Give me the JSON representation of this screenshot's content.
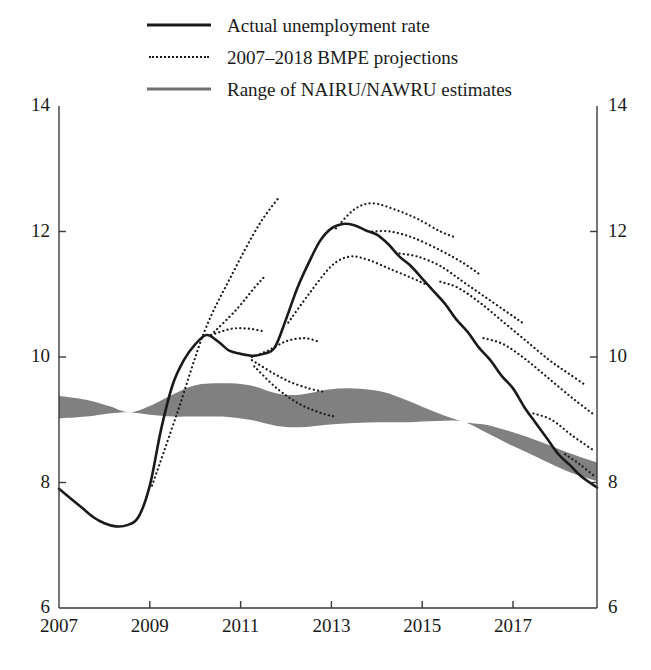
{
  "legend": {
    "position": "top-center",
    "items": [
      {
        "label": "Actual unemployment rate",
        "style": "solid",
        "color": "#1a1a1a",
        "swatch": "solid-line-swatch"
      },
      {
        "label": "2007–2018 BMPE projections",
        "style": "dotted",
        "color": "#1a1a1a",
        "swatch": "dotted-line-swatch"
      },
      {
        "label": "Range of NAIRU/NAWRU estimates",
        "style": "solid-grey",
        "color": "#6f6f6f",
        "swatch": "grey-band-swatch"
      }
    ]
  },
  "axes": {
    "y_left_ticks": [
      "14",
      "12",
      "10",
      "8",
      "6"
    ],
    "y_right_ticks": [
      "14",
      "12",
      "10",
      "8",
      "6"
    ],
    "x_ticks": [
      "2007",
      "2009",
      "2011",
      "2013",
      "2015",
      "2017"
    ],
    "ylim": [
      6,
      14
    ],
    "xlim": [
      2007,
      2018.85
    ],
    "ystep": 2,
    "xstep": 2,
    "grid": false,
    "frame": "left-right-bottom"
  },
  "colors": {
    "line": "#1a1a1a",
    "band": "#808080",
    "band_legend": "#6f6f6f",
    "axis": "#3a3a3a",
    "background": "#ffffff"
  },
  "chart_data": {
    "type": "line",
    "title": "",
    "subtitle": "",
    "xlabel": "",
    "ylabel": "",
    "xlim": [
      2007,
      2018.85
    ],
    "ylim": [
      6,
      14
    ],
    "grid": false,
    "legend_position": "top-center",
    "units": "percent",
    "series": [
      {
        "name": "Actual unemployment rate",
        "style": "solid",
        "color": "#1a1a1a",
        "points": [
          [
            2007.0,
            7.9
          ],
          [
            2007.25,
            7.75
          ],
          [
            2007.5,
            7.6
          ],
          [
            2007.75,
            7.45
          ],
          [
            2008.0,
            7.35
          ],
          [
            2008.25,
            7.3
          ],
          [
            2008.5,
            7.32
          ],
          [
            2008.75,
            7.45
          ],
          [
            2009.0,
            7.95
          ],
          [
            2009.25,
            8.85
          ],
          [
            2009.5,
            9.55
          ],
          [
            2009.75,
            9.95
          ],
          [
            2010.0,
            10.2
          ],
          [
            2010.25,
            10.35
          ],
          [
            2010.5,
            10.25
          ],
          [
            2010.75,
            10.1
          ],
          [
            2011.0,
            10.05
          ],
          [
            2011.25,
            10.02
          ],
          [
            2011.5,
            10.05
          ],
          [
            2011.75,
            10.15
          ],
          [
            2012.0,
            10.6
          ],
          [
            2012.25,
            11.1
          ],
          [
            2012.5,
            11.5
          ],
          [
            2012.75,
            11.85
          ],
          [
            2013.0,
            12.05
          ],
          [
            2013.25,
            12.12
          ],
          [
            2013.5,
            12.1
          ],
          [
            2013.75,
            12.02
          ],
          [
            2014.0,
            11.95
          ],
          [
            2014.25,
            11.8
          ],
          [
            2014.5,
            11.6
          ],
          [
            2014.75,
            11.45
          ],
          [
            2015.0,
            11.25
          ],
          [
            2015.25,
            11.05
          ],
          [
            2015.5,
            10.85
          ],
          [
            2015.75,
            10.6
          ],
          [
            2016.0,
            10.4
          ],
          [
            2016.25,
            10.15
          ],
          [
            2016.5,
            9.95
          ],
          [
            2016.75,
            9.7
          ],
          [
            2017.0,
            9.5
          ],
          [
            2017.25,
            9.2
          ],
          [
            2017.5,
            8.95
          ],
          [
            2017.75,
            8.7
          ],
          [
            2018.0,
            8.45
          ],
          [
            2018.25,
            8.28
          ],
          [
            2018.5,
            8.1
          ],
          [
            2018.85,
            7.92
          ]
        ]
      }
    ],
    "projections": {
      "name": "2007–2018 BMPE projections",
      "style": "dotted",
      "color": "#1a1a1a",
      "vintages": [
        {
          "vintage": "2009",
          "points": [
            [
              2009.05,
              7.95
            ],
            [
              2009.6,
              9.1
            ],
            [
              2010.2,
              10.4
            ],
            [
              2010.8,
              11.3
            ],
            [
              2011.4,
              12.1
            ],
            [
              2011.85,
              12.55
            ]
          ]
        },
        {
          "vintage": "2010",
          "points": [
            [
              2010.35,
              10.35
            ],
            [
              2010.9,
              10.75
            ],
            [
              2011.3,
              11.1
            ],
            [
              2011.55,
              11.3
            ]
          ]
        },
        {
          "vintage": "2010b",
          "points": [
            [
              2010.35,
              10.35
            ],
            [
              2010.8,
              10.45
            ],
            [
              2011.2,
              10.45
            ],
            [
              2011.55,
              10.4
            ]
          ]
        },
        {
          "vintage": "2011",
          "points": [
            [
              2011.25,
              10.0
            ],
            [
              2011.6,
              10.1
            ],
            [
              2012.0,
              10.25
            ],
            [
              2012.4,
              10.3
            ],
            [
              2012.7,
              10.25
            ]
          ]
        },
        {
          "vintage": "2011b",
          "points": [
            [
              2011.25,
              9.95
            ],
            [
              2011.7,
              9.75
            ],
            [
              2012.1,
              9.6
            ],
            [
              2012.5,
              9.5
            ],
            [
              2012.8,
              9.45
            ]
          ]
        },
        {
          "vintage": "2011c",
          "points": [
            [
              2011.3,
              9.85
            ],
            [
              2011.8,
              9.5
            ],
            [
              2012.3,
              9.25
            ],
            [
              2012.8,
              9.1
            ],
            [
              2013.1,
              9.05
            ]
          ]
        },
        {
          "vintage": "2012",
          "points": [
            [
              2012.05,
              10.55
            ],
            [
              2012.5,
              11.0
            ],
            [
              2013.0,
              11.45
            ],
            [
              2013.4,
              11.6
            ],
            [
              2013.8,
              11.55
            ],
            [
              2014.3,
              11.4
            ],
            [
              2014.8,
              11.25
            ],
            [
              2015.1,
              11.15
            ]
          ]
        },
        {
          "vintage": "2013",
          "points": [
            [
              2013.1,
              12.05
            ],
            [
              2013.5,
              12.35
            ],
            [
              2013.9,
              12.45
            ],
            [
              2014.4,
              12.35
            ],
            [
              2014.9,
              12.2
            ],
            [
              2015.4,
              12.0
            ],
            [
              2015.75,
              11.9
            ]
          ]
        },
        {
          "vintage": "2013b",
          "points": [
            [
              2013.9,
              12.0
            ],
            [
              2014.3,
              12.0
            ],
            [
              2014.8,
              11.9
            ],
            [
              2015.4,
              11.7
            ],
            [
              2015.9,
              11.5
            ],
            [
              2016.3,
              11.3
            ]
          ]
        },
        {
          "vintage": "2014",
          "points": [
            [
              2014.5,
              11.65
            ],
            [
              2014.9,
              11.6
            ],
            [
              2015.4,
              11.45
            ],
            [
              2015.9,
              11.2
            ],
            [
              2016.4,
              10.95
            ],
            [
              2016.9,
              10.7
            ],
            [
              2017.2,
              10.55
            ]
          ]
        },
        {
          "vintage": "2015",
          "points": [
            [
              2015.4,
              11.2
            ],
            [
              2015.8,
              11.1
            ],
            [
              2016.3,
              10.85
            ],
            [
              2016.8,
              10.55
            ],
            [
              2017.3,
              10.25
            ],
            [
              2017.8,
              9.95
            ],
            [
              2018.2,
              9.75
            ],
            [
              2018.6,
              9.55
            ]
          ]
        },
        {
          "vintage": "2016",
          "points": [
            [
              2016.35,
              10.3
            ],
            [
              2016.8,
              10.2
            ],
            [
              2017.3,
              9.95
            ],
            [
              2017.8,
              9.65
            ],
            [
              2018.3,
              9.35
            ],
            [
              2018.75,
              9.1
            ]
          ]
        },
        {
          "vintage": "2017",
          "points": [
            [
              2017.45,
              9.1
            ],
            [
              2017.85,
              9.0
            ],
            [
              2018.3,
              8.75
            ],
            [
              2018.8,
              8.5
            ]
          ]
        },
        {
          "vintage": "2018",
          "points": [
            [
              2018.15,
              8.45
            ],
            [
              2018.45,
              8.3
            ],
            [
              2018.8,
              8.1
            ]
          ]
        }
      ]
    },
    "band": {
      "name": "Range of NAIRU/NAWRU estimates",
      "color": "#808080",
      "upper": [
        [
          2007.0,
          9.38
        ],
        [
          2007.6,
          9.32
        ],
        [
          2008.1,
          9.22
        ],
        [
          2008.55,
          9.12
        ],
        [
          2009.0,
          9.22
        ],
        [
          2009.5,
          9.4
        ],
        [
          2010.0,
          9.55
        ],
        [
          2010.6,
          9.58
        ],
        [
          2011.2,
          9.55
        ],
        [
          2011.8,
          9.42
        ],
        [
          2012.3,
          9.4
        ],
        [
          2012.9,
          9.48
        ],
        [
          2013.5,
          9.5
        ],
        [
          2014.1,
          9.45
        ],
        [
          2014.7,
          9.3
        ],
        [
          2015.3,
          9.12
        ],
        [
          2015.9,
          8.97
        ],
        [
          2016.4,
          8.92
        ],
        [
          2017.0,
          8.8
        ],
        [
          2017.6,
          8.65
        ],
        [
          2018.2,
          8.48
        ],
        [
          2018.85,
          8.32
        ]
      ],
      "lower": [
        [
          2007.0,
          9.02
        ],
        [
          2007.6,
          9.05
        ],
        [
          2008.1,
          9.1
        ],
        [
          2008.55,
          9.12
        ],
        [
          2009.0,
          9.08
        ],
        [
          2009.5,
          9.05
        ],
        [
          2010.0,
          9.05
        ],
        [
          2010.6,
          9.05
        ],
        [
          2011.2,
          9.0
        ],
        [
          2011.8,
          8.9
        ],
        [
          2012.3,
          8.88
        ],
        [
          2012.9,
          8.92
        ],
        [
          2013.5,
          8.95
        ],
        [
          2014.1,
          8.96
        ],
        [
          2014.7,
          8.96
        ],
        [
          2015.3,
          8.98
        ],
        [
          2015.9,
          8.97
        ],
        [
          2016.4,
          8.8
        ],
        [
          2017.0,
          8.58
        ],
        [
          2017.6,
          8.38
        ],
        [
          2018.2,
          8.18
        ],
        [
          2018.85,
          8.02
        ]
      ]
    }
  }
}
